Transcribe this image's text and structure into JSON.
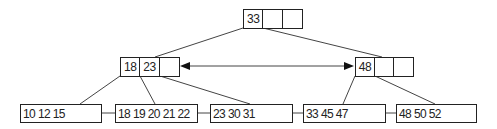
{
  "diagram": {
    "type": "B+ tree",
    "line_color": "#222222",
    "root": {
      "keys": [
        "33",
        "",
        ""
      ]
    },
    "internal": [
      {
        "keys": [
          "18",
          "23",
          ""
        ]
      },
      {
        "keys": [
          "48",
          "",
          ""
        ]
      }
    ],
    "leaves": [
      {
        "label": "10 12 15"
      },
      {
        "label": "18 19 20 21 22"
      },
      {
        "label": "23 30 31"
      },
      {
        "label": "33 45 47"
      },
      {
        "label": "48 50 52"
      }
    ],
    "sibling_link": "bidirectional arrow between internal nodes"
  }
}
